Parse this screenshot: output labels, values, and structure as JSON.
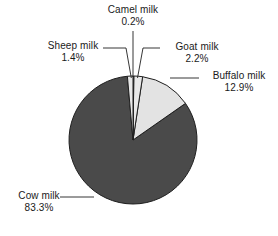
{
  "chart_data": {
    "type": "pie",
    "title": "",
    "subtitle": "",
    "xlabel": "",
    "ylabel": "",
    "legend_position": "none",
    "grid": false,
    "value_unit": "%",
    "start_angle_deg": 0,
    "direction": "clockwise",
    "categories": [
      "Camel milk",
      "Goat milk",
      "Buffalo milk",
      "Cow milk",
      "Sheep milk"
    ],
    "values": [
      0.2,
      2.2,
      12.9,
      83.3,
      1.4
    ],
    "slices": [
      {
        "label": "Camel milk",
        "value_text": "0.2%",
        "value": 0.2,
        "color": "#e8e8e8",
        "leader": "vertical"
      },
      {
        "label": "Goat milk",
        "value_text": "2.2%",
        "value": 2.2,
        "color": "#e8e8e8",
        "leader": "right"
      },
      {
        "label": "Buffalo milk",
        "value_text": "12.9%",
        "value": 12.9,
        "color": "#e3e3e3",
        "leader": "right"
      },
      {
        "label": "Cow milk",
        "value_text": "83.3%",
        "value": 83.3,
        "color": "#4a4a4a",
        "leader": "left"
      },
      {
        "label": "Sheep milk",
        "value_text": "1.4%",
        "value": 1.4,
        "color": "#e8e8e8",
        "leader": "left"
      }
    ],
    "colors": {
      "cow_slice": "#4a4a4a",
      "buffalo_slice": "#e3e3e3",
      "goat_slice": "#e8e8e8",
      "camel_slice": "#e8e8e8",
      "sheep_slice": "#e8e8e8",
      "outline": "#1f1f1f",
      "leader_line": "#1f1f1f",
      "background": "#ffffff",
      "text": "#1a1a1a"
    },
    "geometry": {
      "center_x": 133,
      "center_y": 140,
      "radius": 64
    }
  }
}
